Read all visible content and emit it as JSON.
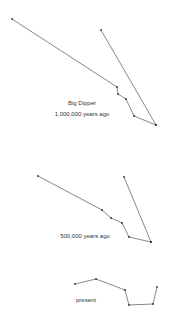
{
  "diagram": {
    "line_color": "#555555",
    "point_color": "#333333",
    "panels": [
      {
        "title": "Big Dipper",
        "caption": "1,000,000 years ago",
        "title_pos": [
          82,
          103
        ],
        "caption_pos": [
          82,
          114
        ],
        "handle_path": [
          [
            12,
            19
          ],
          [
            117,
            87
          ],
          [
            118,
            94
          ],
          [
            126,
            99
          ],
          [
            134,
            116
          ],
          [
            156,
            125
          ]
        ],
        "bowl_path": [
          [
            101,
            30
          ],
          [
            156,
            125
          ]
        ]
      },
      {
        "title": "",
        "caption": "500,000 years ago",
        "caption_pos": [
          85,
          236
        ],
        "handle_path": [
          [
            38,
            176
          ],
          [
            102,
            210
          ],
          [
            111,
            218
          ],
          [
            122,
            223
          ],
          [
            129,
            237
          ],
          [
            151,
            242
          ]
        ],
        "bowl_path": [
          [
            124,
            177
          ],
          [
            151,
            242
          ]
        ]
      },
      {
        "title": "",
        "caption": "present",
        "caption_pos": [
          86,
          300
        ],
        "handle_path": [
          [
            75,
            284
          ],
          [
            96,
            279
          ],
          [
            125,
            290
          ],
          [
            129,
            305
          ],
          [
            153,
            304
          ],
          [
            157,
            287
          ]
        ],
        "bowl_path": []
      }
    ]
  }
}
